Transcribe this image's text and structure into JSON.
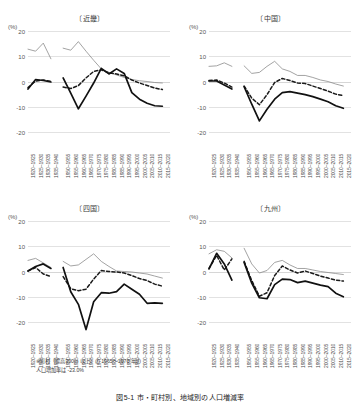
{
  "figure": {
    "caption": "図5-1 市・町村別、地域別の人口増減率",
    "note_line1": "※町村（標高300m 以上）の 1965～1970 年の",
    "note_line2": "人口増加率は -23.0%"
  },
  "axis": {
    "unit_label": "(%)",
    "yticks": [
      "20",
      "10",
      "0",
      "-10",
      "-20"
    ],
    "ylim": [
      -20,
      20
    ],
    "xticks_prewar": [
      "1920~1925",
      "1925~1930",
      "1930~1935",
      "1935~1940"
    ],
    "xticks_postwar": [
      "1950~1955",
      "1955~1960",
      "1960~1965",
      "1965~1970",
      "1970~1975",
      "1975~1980",
      "1980~1985",
      "1985~1990",
      "1990~1995",
      "1995~2000",
      "2000~2005",
      "2005~2010",
      "2010~2015",
      "2015~2020"
    ]
  },
  "colors": {
    "thin_line": "#8c8c8c",
    "dashed_line": "#1a1a1a",
    "thick_line": "#111111",
    "grid": "#e2e2e2"
  },
  "chart_data": [
    {
      "type": "line",
      "title": "〔近畿〕",
      "xlabel": "",
      "ylabel": "(%)",
      "ylim": [
        -20,
        20
      ],
      "grid": true,
      "legend": "none",
      "x_prewar": [
        "1920~1925",
        "1925~1930",
        "1930~1935",
        "1935~1940"
      ],
      "x_postwar": [
        "1950~1955",
        "1955~1960",
        "1960~1965",
        "1965~1970",
        "1970~1975",
        "1975~1980",
        "1980~1985",
        "1985~1990",
        "1990~1995",
        "1995~2000",
        "2000~2005",
        "2005~2010",
        "2010~2015",
        "2015~2020"
      ],
      "series": [
        {
          "name": "市",
          "style": "thin",
          "values_prewar": [
            12.8,
            12.0,
            15.2,
            9.0
          ],
          "values_postwar": [
            13.2,
            12.4,
            15.8,
            12.0,
            8.4,
            5.0,
            3.6,
            2.6,
            1.6,
            0.8,
            0.3,
            0.0,
            -0.4,
            -0.6
          ]
        },
        {
          "name": "町村（低地）",
          "style": "dashed",
          "values_prewar": [
            -2.4,
            0.2,
            0.6,
            0.0
          ],
          "values_postwar": [
            -2.2,
            -2.8,
            -1.6,
            1.4,
            4.0,
            4.6,
            3.4,
            3.0,
            2.2,
            0.6,
            -0.6,
            -1.6,
            -2.6,
            -3.2
          ]
        },
        {
          "name": "町村（高地）",
          "style": "thick",
          "values_prewar": [
            -3.0,
            0.8,
            0.4,
            -0.2
          ],
          "values_postwar": [
            1.4,
            -4.6,
            -10.8,
            -5.8,
            -0.6,
            5.2,
            3.0,
            5.0,
            3.2,
            -4.4,
            -7.0,
            -8.6,
            -9.6,
            -9.8
          ]
        }
      ]
    },
    {
      "type": "line",
      "title": "〔中国〕",
      "xlabel": "",
      "ylabel": "(%)",
      "ylim": [
        -20,
        20
      ],
      "grid": true,
      "legend": "none",
      "x_prewar": [
        "1920~1925",
        "1925~1930",
        "1930~1935",
        "1935~1940"
      ],
      "x_postwar": [
        "1950~1955",
        "1955~1960",
        "1960~1965",
        "1965~1970",
        "1970~1975",
        "1975~1980",
        "1980~1985",
        "1985~1990",
        "1990~1995",
        "1995~2000",
        "2000~2005",
        "2005~2010",
        "2010~2015",
        "2015~2020"
      ],
      "series": [
        {
          "name": "市",
          "style": "thin",
          "values_prewar": [
            6.0,
            6.2,
            7.4,
            6.0
          ],
          "values_postwar": [
            6.2,
            3.2,
            3.6,
            6.0,
            8.0,
            5.0,
            4.0,
            2.4,
            2.4,
            1.6,
            0.6,
            0.0,
            -1.0,
            -1.8
          ]
        },
        {
          "name": "町村（低地）",
          "style": "dashed",
          "values_prewar": [
            0.4,
            0.6,
            -0.6,
            -2.2
          ],
          "values_postwar": [
            -1.8,
            -6.6,
            -9.2,
            -5.2,
            -0.4,
            1.2,
            0.4,
            -0.6,
            -0.8,
            -1.8,
            -2.8,
            -3.8,
            -5.0,
            -5.6
          ]
        },
        {
          "name": "町村（高地）",
          "style": "thick",
          "values_prewar": [
            0.2,
            0.2,
            -1.4,
            -3.0
          ],
          "values_postwar": [
            -2.0,
            -9.0,
            -15.6,
            -11.0,
            -7.0,
            -4.4,
            -4.0,
            -4.6,
            -5.2,
            -6.0,
            -7.0,
            -8.0,
            -9.6,
            -10.6
          ]
        }
      ]
    },
    {
      "type": "line",
      "title": "〔四国〕",
      "xlabel": "",
      "ylabel": "(%)",
      "ylim": [
        -20,
        20
      ],
      "grid": true,
      "legend": "none",
      "x_prewar": [
        "1920~1925",
        "1925~1930",
        "1930~1935",
        "1935~1940"
      ],
      "x_postwar": [
        "1950~1955",
        "1955~1960",
        "1960~1965",
        "1965~1970",
        "1970~1975",
        "1975~1980",
        "1980~1985",
        "1985~1990",
        "1990~1995",
        "1995~2000",
        "2000~2005",
        "2005~2010",
        "2010~2015",
        "2015~2020"
      ],
      "series": [
        {
          "name": "市",
          "style": "thin",
          "values_prewar": [
            4.4,
            5.2,
            3.4,
            1.6
          ],
          "values_postwar": [
            4.0,
            2.2,
            2.6,
            4.8,
            7.0,
            4.0,
            2.0,
            0.2,
            0.0,
            -0.2,
            -0.6,
            -1.0,
            -1.8,
            -2.6
          ]
        },
        {
          "name": "町村（低地）",
          "style": "dashed",
          "values_prewar": [
            0.2,
            1.6,
            -1.0,
            -2.0
          ],
          "values_postwar": [
            -2.0,
            -6.8,
            -7.6,
            -7.0,
            -3.0,
            0.4,
            0.0,
            -0.2,
            -0.6,
            -1.6,
            -2.8,
            -3.6,
            -5.0,
            -5.8
          ]
        },
        {
          "name": "町村（高地）",
          "style": "thick",
          "values_prewar": [
            0.2,
            2.0,
            3.0,
            1.2
          ],
          "values_postwar": [
            1.6,
            -8.0,
            -13.0,
            -23.0,
            -12.0,
            -8.4,
            -8.6,
            -8.0,
            -5.0,
            -7.0,
            -9.0,
            -12.6,
            -12.4,
            -12.6
          ]
        }
      ]
    },
    {
      "type": "line",
      "title": "〔九州〕",
      "xlabel": "",
      "ylabel": "(%)",
      "ylim": [
        -20,
        20
      ],
      "grid": true,
      "legend": "none",
      "x_prewar": [
        "1920~1925",
        "1925~1930",
        "1930~1935",
        "1935~1940"
      ],
      "x_postwar": [
        "1950~1955",
        "1955~1960",
        "1960~1965",
        "1965~1970",
        "1970~1975",
        "1975~1980",
        "1980~1985",
        "1985~1990",
        "1990~1995",
        "1995~2000",
        "2000~2005",
        "2005~2010",
        "2010~2015",
        "2015~2020"
      ],
      "series": [
        {
          "name": "市",
          "style": "thin",
          "values_prewar": [
            7.0,
            8.6,
            8.0,
            5.4
          ],
          "values_postwar": [
            9.2,
            3.0,
            -0.6,
            0.4,
            3.6,
            4.4,
            2.6,
            1.2,
            1.2,
            0.6,
            0.0,
            -0.4,
            -0.8,
            -1.2
          ]
        },
        {
          "name": "町村（低地）",
          "style": "dashed",
          "values_prewar": [
            1.2,
            6.4,
            0.6,
            5.0
          ],
          "values_postwar": [
            4.0,
            -3.6,
            -9.8,
            -8.4,
            -1.6,
            2.2,
            0.6,
            -0.6,
            0.2,
            -0.8,
            -1.8,
            -2.6,
            -3.4,
            -3.8
          ]
        },
        {
          "name": "町村（高地）",
          "style": "thick",
          "values_prewar": [
            1.0,
            7.2,
            3.0,
            -3.4
          ],
          "values_postwar": [
            3.6,
            -4.6,
            -10.4,
            -10.8,
            -5.2,
            -3.0,
            -3.2,
            -4.4,
            -3.8,
            -4.6,
            -5.4,
            -6.0,
            -8.6,
            -10.0
          ]
        }
      ]
    }
  ]
}
